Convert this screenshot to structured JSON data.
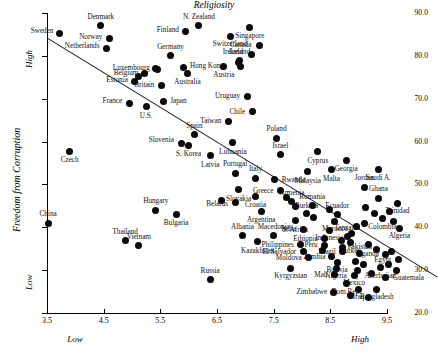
{
  "chart_data": {
    "type": "scatter",
    "title": "",
    "xlabel": "Religiosity",
    "ylabel": "Freedom from Corruption",
    "xlim": [
      3.5,
      10.0
    ],
    "ylim": [
      20.0,
      90.0
    ],
    "grid": false,
    "legend": null,
    "x_ticks": [
      "3.5",
      "4.5",
      "5.5",
      "6.5",
      "7.5",
      "8.5",
      "9.5"
    ],
    "y_ticks": [
      "20.0",
      "30.0",
      "40.0",
      "50.0",
      "60.0",
      "70.0",
      "80.0",
      "90.0"
    ],
    "axis_annotations": {
      "x_low": "Low",
      "x_high": "High",
      "y_low": "Low",
      "y_high": "High"
    },
    "trendline": {
      "x0": 3.52,
      "y0": 84.1,
      "x1": 10.4,
      "y1": 28.4
    },
    "points": [
      {
        "label": "Sweden",
        "x": 3.72,
        "y": 85.3,
        "lx": -6,
        "ly": -1,
        "anchor": "r"
      },
      {
        "label": "Denmark",
        "x": 4.45,
        "y": 87.0,
        "lx": 0,
        "ly": -8,
        "anchor": "c"
      },
      {
        "label": "Norway",
        "x": 4.6,
        "y": 84.0,
        "lx": -7,
        "ly": -1,
        "anchor": "r"
      },
      {
        "label": "Netherlands",
        "x": 4.55,
        "y": 81.8,
        "lx": -7,
        "ly": -1,
        "anchor": "r"
      },
      {
        "label": "Finland",
        "x": 5.95,
        "y": 85.6,
        "lx": -7,
        "ly": -1,
        "anchor": "r"
      },
      {
        "label": "N. Zealand",
        "x": 6.18,
        "y": 87.0,
        "lx": 0,
        "ly": -8,
        "anchor": "c"
      },
      {
        "label": "Switzerland",
        "x": 6.73,
        "y": 84.6,
        "lx": 0,
        "ly": 9,
        "anchor": "c"
      },
      {
        "label": "Germany",
        "x": 5.68,
        "y": 80.0,
        "lx": 0,
        "ly": -8,
        "anchor": "c"
      },
      {
        "label": "Luxembourg",
        "x": 5.42,
        "y": 77.1,
        "lx": -6,
        "ly": 1,
        "anchor": "r"
      },
      {
        "label": "Belgium",
        "x": 5.22,
        "y": 76.0,
        "lx": -6,
        "ly": 1,
        "anchor": "r"
      },
      {
        "label": "Hong Kong",
        "x": 5.9,
        "y": 77.3,
        "lx": 7,
        "ly": 0,
        "anchor": "l"
      },
      {
        "label": "Australia",
        "x": 5.98,
        "y": 75.8,
        "lx": 0,
        "ly": 9,
        "anchor": "c"
      },
      {
        "label": "Austria",
        "x": 6.62,
        "y": 77.5,
        "lx": 0,
        "ly": 9,
        "anchor": "c"
      },
      {
        "label": "Iceland",
        "x": 6.9,
        "y": 78.9,
        "lx": 0,
        "ly": -8,
        "anchor": "c"
      },
      {
        "label": "Estonia",
        "x": 5.05,
        "y": 74.0,
        "lx": -7,
        "ly": -1,
        "anchor": "r"
      },
      {
        "label": "Britain",
        "x": 5.52,
        "y": 73.0,
        "lx": -7,
        "ly": 0,
        "anchor": "r"
      },
      {
        "label": "Japan",
        "x": 5.55,
        "y": 69.3,
        "lx": 7,
        "ly": 0,
        "anchor": "l"
      },
      {
        "label": "France",
        "x": 4.95,
        "y": 69.0,
        "lx": -7,
        "ly": -1,
        "anchor": "r"
      },
      {
        "label": "U.S.",
        "x": 5.25,
        "y": 68.1,
        "lx": 0,
        "ly": 10,
        "anchor": "c"
      },
      {
        "label": "Singapore",
        "x": 7.08,
        "y": 86.6,
        "lx": 0,
        "ly": 9,
        "anchor": "c"
      },
      {
        "label": "Canada",
        "x": 7.25,
        "y": 82.5,
        "lx": -8,
        "ly": 1,
        "anchor": "r"
      },
      {
        "label": "Ireland",
        "x": 7.1,
        "y": 80.4,
        "lx": -8,
        "ly": -1,
        "anchor": "r"
      },
      {
        "label": "Uruguay",
        "x": 7.03,
        "y": 70.6,
        "lx": -7,
        "ly": 1,
        "anchor": "r"
      },
      {
        "label": "Chile",
        "x": 7.12,
        "y": 67.0,
        "lx": -7,
        "ly": 1,
        "anchor": "r"
      },
      {
        "label": "Taiwan",
        "x": 6.7,
        "y": 64.8,
        "lx": -7,
        "ly": 1,
        "anchor": "r"
      },
      {
        "label": "Spain",
        "x": 6.1,
        "y": 61.6,
        "lx": 0,
        "ly": -8,
        "anchor": "c"
      },
      {
        "label": "Slovenia",
        "x": 5.88,
        "y": 59.6,
        "lx": -8,
        "ly": -2,
        "anchor": "r"
      },
      {
        "label": "S. Korea",
        "x": 6.0,
        "y": 59.1,
        "lx": 0,
        "ly": 10,
        "anchor": "c"
      },
      {
        "label": "Czech",
        "x": 3.9,
        "y": 57.8,
        "lx": 0,
        "ly": 10,
        "anchor": "c"
      },
      {
        "label": "Latvia",
        "x": 6.38,
        "y": 56.7,
        "lx": 0,
        "ly": 10,
        "anchor": "c"
      },
      {
        "label": "Lithuania",
        "x": 6.78,
        "y": 59.7,
        "lx": 0,
        "ly": 10,
        "anchor": "c"
      },
      {
        "label": "Poland",
        "x": 7.55,
        "y": 60.8,
        "lx": 0,
        "ly": -8,
        "anchor": "c"
      },
      {
        "label": "Israel",
        "x": 7.62,
        "y": 56.9,
        "lx": 0,
        "ly": -8,
        "anchor": "c"
      },
      {
        "label": "Cyprus",
        "x": 8.28,
        "y": 57.6,
        "lx": 0,
        "ly": 10,
        "anchor": "c"
      },
      {
        "label": "Georgia",
        "x": 8.78,
        "y": 55.6,
        "lx": 0,
        "ly": 10,
        "anchor": "c"
      },
      {
        "label": "Saudi A.",
        "x": 9.35,
        "y": 53.5,
        "lx": 0,
        "ly": 10,
        "anchor": "c"
      },
      {
        "label": "Malta",
        "x": 8.52,
        "y": 53.4,
        "lx": 0,
        "ly": 10,
        "anchor": "c"
      },
      {
        "label": "Malaysia",
        "x": 8.1,
        "y": 53.0,
        "lx": 0,
        "ly": 10,
        "anchor": "c"
      },
      {
        "label": "Portugal",
        "x": 6.82,
        "y": 52.6,
        "lx": 0,
        "ly": -8,
        "anchor": "c"
      },
      {
        "label": "Italy",
        "x": 7.18,
        "y": 51.4,
        "lx": 0,
        "ly": -8,
        "anchor": "c"
      },
      {
        "label": "Rwanda",
        "x": 7.52,
        "y": 51.1,
        "lx": 7,
        "ly": 1,
        "anchor": "l"
      },
      {
        "label": "Greece",
        "x": 7.62,
        "y": 48.5,
        "lx": -7,
        "ly": 1,
        "anchor": "r"
      },
      {
        "label": "Slovakia",
        "x": 6.88,
        "y": 48.8,
        "lx": 0,
        "ly": 10,
        "anchor": "c"
      },
      {
        "label": "Croatia",
        "x": 7.18,
        "y": 47.3,
        "lx": 0,
        "ly": 10,
        "anchor": "c"
      },
      {
        "label": "Belarus",
        "x": 6.82,
        "y": 45.8,
        "lx": -7,
        "ly": 3,
        "anchor": "r"
      },
      {
        "label": "Armenia",
        "x": 7.82,
        "y": 46.0,
        "lx": 0,
        "ly": -8,
        "anchor": "c"
      },
      {
        "label": "Romania",
        "x": 8.18,
        "y": 45.0,
        "lx": 0,
        "ly": -8,
        "anchor": "c"
      },
      {
        "label": "Jordan",
        "x": 9.1,
        "y": 49.3,
        "lx": 0,
        "ly": -8,
        "anchor": "c"
      },
      {
        "label": "Ghana",
        "x": 9.35,
        "y": 46.8,
        "lx": 0,
        "ly": -8,
        "anchor": "c"
      },
      {
        "label": "Trinidad",
        "x": 9.68,
        "y": 45.6,
        "lx": 0,
        "ly": 9,
        "anchor": "c"
      },
      {
        "label": "Argentina",
        "x": 7.28,
        "y": 43.8,
        "lx": 0,
        "ly": 10,
        "anchor": "c"
      },
      {
        "label": "Hungary",
        "x": 5.42,
        "y": 44.0,
        "lx": 0,
        "ly": -8,
        "anchor": "c"
      },
      {
        "label": "Bulgaria",
        "x": 5.78,
        "y": 43.0,
        "lx": 0,
        "ly": 10,
        "anchor": "c"
      },
      {
        "label": "Burkina",
        "x": 8.08,
        "y": 43.2,
        "lx": 0,
        "ly": -7,
        "anchor": "c"
      },
      {
        "label": "S. Africa",
        "x": 7.88,
        "y": 41.5,
        "lx": 0,
        "ly": 10,
        "anchor": "c"
      },
      {
        "label": "Ecuador",
        "x": 8.62,
        "y": 43.0,
        "lx": 0,
        "ly": -7,
        "anchor": "c"
      },
      {
        "label": "Morocco",
        "x": 8.58,
        "y": 41.4,
        "lx": 0,
        "ly": 9,
        "anchor": "c"
      },
      {
        "label": "Colombia",
        "x": 9.42,
        "y": 42.0,
        "lx": 0,
        "ly": 9,
        "anchor": "c"
      },
      {
        "label": "Algeria",
        "x": 9.72,
        "y": 39.8,
        "lx": 0,
        "ly": 9,
        "anchor": "c"
      },
      {
        "label": "India",
        "x": 8.02,
        "y": 39.6,
        "lx": -7,
        "ly": 1,
        "anchor": "r"
      },
      {
        "label": "Indonesia",
        "x": 8.48,
        "y": 39.3,
        "lx": 0,
        "ly": 9,
        "anchor": "c"
      },
      {
        "label": "Tanzania",
        "x": 8.8,
        "y": 37.9,
        "lx": 0,
        "ly": -7,
        "anchor": "c"
      },
      {
        "label": "Ethiopia",
        "x": 8.4,
        "y": 37.3,
        "lx": -7,
        "ly": 1,
        "anchor": "r"
      },
      {
        "label": "Turkey",
        "x": 8.86,
        "y": 36.4,
        "lx": 0,
        "ly": 9,
        "anchor": "c"
      },
      {
        "label": "Albania",
        "x": 6.95,
        "y": 38.0,
        "lx": 0,
        "ly": -8,
        "anchor": "c"
      },
      {
        "label": "Macedonia",
        "x": 7.5,
        "y": 38.0,
        "lx": 0,
        "ly": -8,
        "anchor": "c"
      },
      {
        "label": "Kazakhstan",
        "x": 7.22,
        "y": 36.6,
        "lx": 0,
        "ly": 10,
        "anchor": "c"
      },
      {
        "label": "Philippines",
        "x": 7.98,
        "y": 35.9,
        "lx": -7,
        "ly": 1,
        "anchor": "r"
      },
      {
        "label": "Peru",
        "x": 8.4,
        "y": 35.8,
        "lx": -7,
        "ly": 1,
        "anchor": "r"
      },
      {
        "label": "El Salvador",
        "x": 8.02,
        "y": 34.3,
        "lx": -7,
        "ly": 1,
        "anchor": "r"
      },
      {
        "label": "Brazil",
        "x": 8.72,
        "y": 34.3,
        "lx": -7,
        "ly": 1,
        "anchor": "r"
      },
      {
        "label": "Pakistan",
        "x": 9.02,
        "y": 33.8,
        "lx": 0,
        "ly": -6,
        "anchor": "c"
      },
      {
        "label": "Moldova",
        "x": 8.12,
        "y": 32.9,
        "lx": -7,
        "ly": 1,
        "anchor": "r"
      },
      {
        "label": "Zambia",
        "x": 8.52,
        "y": 33.1,
        "lx": -6,
        "ly": 1,
        "anchor": "r"
      },
      {
        "label": "Uganda",
        "x": 9.48,
        "y": 33.7,
        "lx": -7,
        "ly": 1,
        "anchor": "r"
      },
      {
        "label": "Egypt",
        "x": 9.7,
        "y": 32.5,
        "lx": -7,
        "ly": 2,
        "anchor": "r"
      },
      {
        "label": "Bolivia",
        "x": 8.62,
        "y": 31.8,
        "lx": 0,
        "ly": 9,
        "anchor": "c"
      },
      {
        "label": "Nigeria",
        "x": 8.6,
        "y": 30.4,
        "lx": 0,
        "ly": 9,
        "anchor": "c"
      },
      {
        "label": "Azerbaijan",
        "x": 9.38,
        "y": 30.6,
        "lx": 0,
        "ly": 9,
        "anchor": "c"
      },
      {
        "label": "Kyrgyzstan",
        "x": 7.8,
        "y": 30.4,
        "lx": 0,
        "ly": 9,
        "anchor": "c"
      },
      {
        "label": "Mali",
        "x": 8.58,
        "y": 28.9,
        "lx": -7,
        "ly": 1,
        "anchor": "r"
      },
      {
        "label": "Mexico",
        "x": 8.92,
        "y": 28.8,
        "lx": 0,
        "ly": 9,
        "anchor": "c"
      },
      {
        "label": "Guatemala",
        "x": 9.48,
        "y": 28.2,
        "lx": 7,
        "ly": 1,
        "anchor": "l"
      },
      {
        "label": "Dom.Rep.",
        "x": 8.78,
        "y": 26.8,
        "lx": 0,
        "ly": 9,
        "anchor": "c"
      },
      {
        "label": "Iraq",
        "x": 9.0,
        "y": 25.6,
        "lx": 0,
        "ly": 9,
        "anchor": "c"
      },
      {
        "label": "Bangladesh",
        "x": 9.32,
        "y": 25.6,
        "lx": 0,
        "ly": 9,
        "anchor": "c"
      },
      {
        "label": "Zimbabwe",
        "x": 8.55,
        "y": 24.9,
        "lx": -6,
        "ly": 1,
        "anchor": "r"
      },
      {
        "label": "Russia",
        "x": 6.38,
        "y": 27.8,
        "lx": 0,
        "ly": -8,
        "anchor": "c"
      },
      {
        "label": "China",
        "x": 3.52,
        "y": 41.0,
        "lx": 0,
        "ly": -8,
        "anchor": "c"
      },
      {
        "label": "Thailand",
        "x": 4.88,
        "y": 36.9,
        "lx": 0,
        "ly": -8,
        "anchor": "c"
      },
      {
        "label": "Vietnam",
        "x": 5.12,
        "y": 35.8,
        "lx": 0,
        "ly": -7,
        "anchor": "c"
      }
    ],
    "extra_points": [
      {
        "x": 5.45,
        "y": 76.9
      },
      {
        "x": 5.12,
        "y": 75.3
      },
      {
        "x": 6.88,
        "y": 78.4
      },
      {
        "x": 6.92,
        "y": 77.6
      },
      {
        "x": 9.12,
        "y": 44.6
      },
      {
        "x": 9.55,
        "y": 43.8
      },
      {
        "x": 9.28,
        "y": 43.2
      },
      {
        "x": 9.1,
        "y": 40.9
      },
      {
        "x": 8.96,
        "y": 40.2
      },
      {
        "x": 9.62,
        "y": 41.3
      },
      {
        "x": 8.88,
        "y": 38.6
      },
      {
        "x": 9.18,
        "y": 36.0
      },
      {
        "x": 8.72,
        "y": 35.3
      },
      {
        "x": 9.32,
        "y": 34.8
      },
      {
        "x": 9.58,
        "y": 34.4
      },
      {
        "x": 8.94,
        "y": 32.0
      },
      {
        "x": 9.08,
        "y": 31.4
      },
      {
        "x": 8.98,
        "y": 30.0
      },
      {
        "x": 9.22,
        "y": 29.2
      },
      {
        "x": 9.52,
        "y": 31.4
      },
      {
        "x": 9.66,
        "y": 30.0
      },
      {
        "x": 8.86,
        "y": 24.0
      },
      {
        "x": 9.18,
        "y": 23.6
      },
      {
        "x": 8.36,
        "y": 34.6
      },
      {
        "x": 8.2,
        "y": 42.2
      },
      {
        "x": 8.48,
        "y": 44.2
      },
      {
        "x": 7.88,
        "y": 44.9
      },
      {
        "x": 8.7,
        "y": 36.9
      },
      {
        "x": 7.72,
        "y": 47.0
      },
      {
        "x": 6.58,
        "y": 46.3
      }
    ]
  }
}
